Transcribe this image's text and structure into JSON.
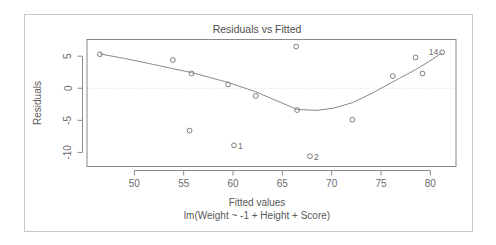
{
  "chart_data": {
    "type": "scatter",
    "title": "Residuals vs Fitted",
    "xlabel": "Fitted values",
    "sublabel": "lm(Weight ~ -1 + Height + Score)",
    "ylabel": "Residuals",
    "xlim": [
      45.2,
      82.6
    ],
    "ylim": [
      -12.2,
      7.6
    ],
    "xticks": [
      50,
      55,
      60,
      65,
      70,
      75,
      80
    ],
    "yticks": [
      5,
      0,
      -5,
      -10
    ],
    "xtick_labels": [
      "50",
      "55",
      "60",
      "65",
      "70",
      "75",
      "80"
    ],
    "ytick_labels": [
      "5",
      "0",
      "-5",
      "-10"
    ],
    "grid": false,
    "legend": false,
    "zero_reference_line": 0,
    "colors": {
      "point": "#7d7d7d",
      "curve": "#8a8a8a",
      "axis": "#8a8a8a",
      "zero_line": "#d9d9d9",
      "text": "#595959",
      "frame": "#c8c8c8",
      "background": "#ffffff"
    },
    "points": [
      {
        "x": 46.5,
        "y": 5.3,
        "label": ""
      },
      {
        "x": 53.9,
        "y": 4.4,
        "label": ""
      },
      {
        "x": 55.8,
        "y": 2.3,
        "label": ""
      },
      {
        "x": 55.6,
        "y": -6.6,
        "label": ""
      },
      {
        "x": 59.5,
        "y": 0.6,
        "label": ""
      },
      {
        "x": 60.1,
        "y": -8.9,
        "label": "1"
      },
      {
        "x": 62.3,
        "y": -1.2,
        "label": ""
      },
      {
        "x": 66.4,
        "y": 6.5,
        "label": ""
      },
      {
        "x": 66.5,
        "y": -3.4,
        "label": ""
      },
      {
        "x": 67.8,
        "y": -10.6,
        "label": "2"
      },
      {
        "x": 72.1,
        "y": -4.9,
        "label": ""
      },
      {
        "x": 76.2,
        "y": 1.9,
        "label": ""
      },
      {
        "x": 78.5,
        "y": 4.8,
        "label": ""
      },
      {
        "x": 79.2,
        "y": 2.3,
        "label": ""
      },
      {
        "x": 81.2,
        "y": 5.6,
        "label": "14"
      }
    ],
    "smoother": {
      "name": "lowess",
      "x": [
        46.5,
        49.0,
        51.5,
        53.9,
        55.8,
        57.6,
        59.5,
        62.3,
        64.5,
        66.5,
        68.5,
        70.2,
        72.1,
        74.0,
        76.2,
        78.5,
        79.8,
        81.2
      ],
      "y": [
        5.35,
        4.65,
        3.85,
        3.05,
        2.45,
        1.7,
        0.9,
        -0.55,
        -2.0,
        -3.3,
        -3.45,
        -3.1,
        -2.25,
        -0.85,
        1.0,
        2.9,
        4.1,
        5.55
      ]
    }
  }
}
